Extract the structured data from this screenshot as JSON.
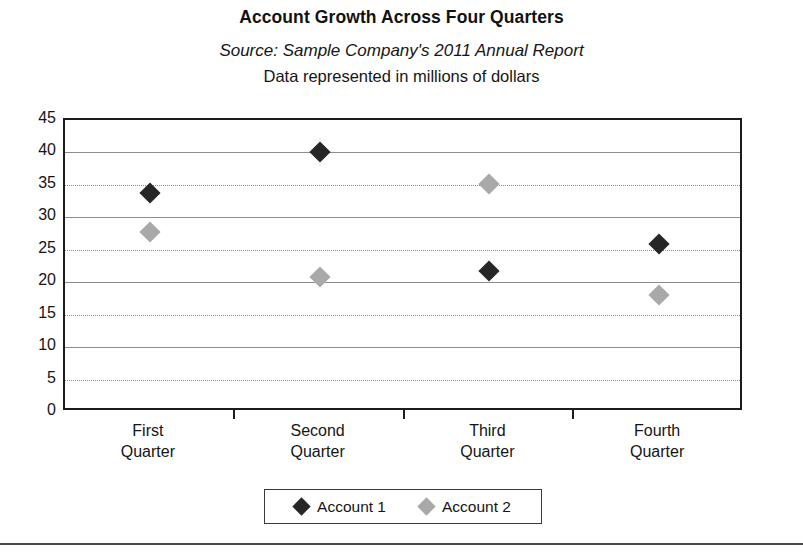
{
  "chart_data": {
    "type": "scatter",
    "title": "Account Growth Across Four Quarters",
    "source": "Source: Sample Company's 2011 Annual Report",
    "subtitle": "Data represented in millions of dollars",
    "xlabel": "",
    "ylabel": "",
    "ylim": [
      0,
      45
    ],
    "ytick_step": 5,
    "yticks": [
      45,
      40,
      35,
      30,
      25,
      20,
      15,
      10,
      5,
      0
    ],
    "categories": [
      "First\nQuarter",
      "Second\nQuarter",
      "Third\nQuarter",
      "Fourth\nQuarter"
    ],
    "grid": "horizontal",
    "legend_position": "bottom",
    "series": [
      {
        "name": "Account 1",
        "color": "#262626",
        "marker": "diamond",
        "values": [
          33.7,
          40.0,
          21.7,
          25.9
        ]
      },
      {
        "name": "Account 2",
        "color": "#a9a9a9",
        "marker": "diamond",
        "values": [
          27.8,
          20.8,
          35.2,
          18.1
        ]
      }
    ]
  },
  "legend": {
    "items": [
      {
        "label": "Account 1"
      },
      {
        "label": "Account 2"
      }
    ]
  },
  "colors": {
    "series_1": "#262626",
    "series_2": "#a9a9a9",
    "axis": "#1c1c1c",
    "gridline": "#8d8d8d",
    "background": "#ffffff"
  }
}
